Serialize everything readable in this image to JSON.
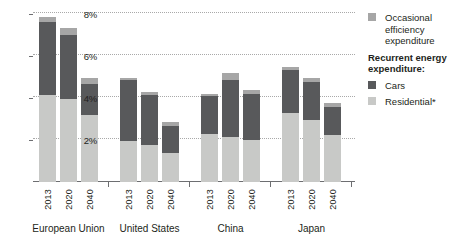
{
  "chart_data": {
    "type": "bar",
    "stacked": true,
    "title": "",
    "xlabel": "",
    "ylabel": "",
    "ylim": [
      0,
      8
    ],
    "grid": true,
    "ytick_labels": [
      "2%",
      "4%",
      "6%",
      "8%"
    ],
    "ytick_values": [
      2,
      4,
      6,
      8
    ],
    "groups": [
      "European Union",
      "United States",
      "China",
      "Japan"
    ],
    "categories": [
      "2013",
      "2020",
      "2040",
      "2013",
      "2020",
      "2040",
      "2013",
      "2020",
      "2040",
      "2013",
      "2020",
      "2040"
    ],
    "legend_position": "right",
    "series": [
      {
        "name": "Residential*",
        "color": "#c8c9c7",
        "values": [
          4.15,
          3.95,
          3.2,
          1.95,
          1.75,
          1.4,
          2.3,
          2.15,
          2.0,
          3.35,
          2.95,
          2.25
        ]
      },
      {
        "name": "Cars",
        "color": "#58595b",
        "values": [
          3.45,
          3.05,
          1.45,
          2.9,
          2.4,
          1.25,
          1.8,
          2.7,
          2.2,
          2.1,
          1.8,
          1.3
        ]
      },
      {
        "name": "Occasional efficiency expenditure",
        "color": "#a6a6a6",
        "values": [
          0.25,
          0.35,
          0.3,
          0.1,
          0.15,
          0.2,
          0.1,
          0.35,
          0.2,
          0.15,
          0.2,
          0.2
        ]
      }
    ],
    "totals": [
      7.85,
      7.35,
      4.95,
      4.95,
      4.3,
      2.85,
      4.2,
      5.2,
      4.4,
      5.5,
      4.95,
      3.75
    ]
  },
  "legend": {
    "occasional_label": "Occasional efficiency expenditure",
    "group_title": "Recurrent energy expenditure:",
    "cars_label": "Cars",
    "residential_label": "Residential*"
  },
  "colors": {
    "occasional": "#a6a6a6",
    "cars": "#58595b",
    "residential": "#c8c9c7",
    "axis": "#6d6e71",
    "grid": "#a9a9a9",
    "text": "#231f20"
  }
}
